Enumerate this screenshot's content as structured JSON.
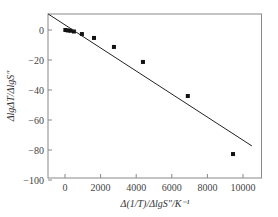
{
  "chart_data": {
    "type": "scatter",
    "title": "",
    "xlabel": "Δ(1/T)/ΔlgS″/K⁻¹",
    "ylabel": "ΔlgΔT/ΔlgS″",
    "xlim": [
      -950,
      11100
    ],
    "ylim": [
      -100,
      10.7
    ],
    "xticks": [
      0,
      2000,
      4000,
      6000,
      8000,
      10000
    ],
    "yticks": [
      0,
      -20,
      -40,
      -60,
      -80,
      -100
    ],
    "grid": false,
    "legend": null,
    "series": [
      {
        "name": "data",
        "kind": "scatter",
        "marker": "square",
        "points": [
          {
            "x": 20,
            "y": 0
          },
          {
            "x": 150,
            "y": -0.3
          },
          {
            "x": 300,
            "y": -0.5
          },
          {
            "x": 500,
            "y": -1
          },
          {
            "x": 950,
            "y": -2.7
          },
          {
            "x": 1630,
            "y": -5.3
          },
          {
            "x": 2750,
            "y": -11.3
          },
          {
            "x": 4380,
            "y": -21.3
          },
          {
            "x": 6900,
            "y": -44
          },
          {
            "x": 9440,
            "y": -82.7
          }
        ]
      },
      {
        "name": "fit",
        "kind": "line",
        "points": [
          {
            "x": -950,
            "y": 10.7
          },
          {
            "x": 10500,
            "y": -77.3
          }
        ]
      }
    ]
  }
}
